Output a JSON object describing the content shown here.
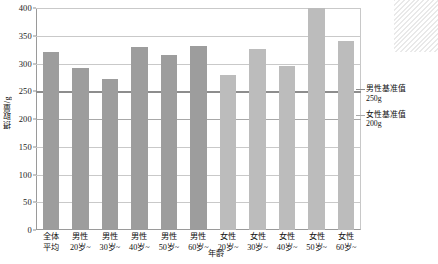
{
  "chart_data": {
    "type": "bar",
    "title": "",
    "xlabel": "年龄",
    "ylabel": "摂取量/g",
    "ylim": [
      0,
      400
    ],
    "ytick_step": 50,
    "yticks": [
      "0",
      "50",
      "100",
      "150",
      "200",
      "250",
      "300",
      "350",
      "400"
    ],
    "grid": true,
    "legend_position": "right",
    "categories": [
      {
        "line1": "全体",
        "line2": "平均",
        "group": "all"
      },
      {
        "line1": "男性",
        "line2": "20岁~",
        "group": "male"
      },
      {
        "line1": "男性",
        "line2": "30岁~",
        "group": "male"
      },
      {
        "line1": "男性",
        "line2": "40岁~",
        "group": "male"
      },
      {
        "line1": "男性",
        "line2": "50岁~",
        "group": "male"
      },
      {
        "line1": "男性",
        "line2": "60岁~",
        "group": "male"
      },
      {
        "line1": "女性",
        "line2": "20岁~",
        "group": "female"
      },
      {
        "line1": "女性",
        "line2": "30岁~",
        "group": "female"
      },
      {
        "line1": "女性",
        "line2": "40岁~",
        "group": "female"
      },
      {
        "line1": "女性",
        "line2": "50岁~",
        "group": "female"
      },
      {
        "line1": "女性",
        "line2": "60岁~",
        "group": "female"
      }
    ],
    "values": [
      320,
      292,
      273,
      330,
      316,
      332,
      280,
      326,
      295,
      414,
      340
    ],
    "reference_lines": [
      {
        "value": 250,
        "label_line1": "男性基准值",
        "label_line2": "250g",
        "color": "#8d8d8d"
      },
      {
        "value": 200,
        "label_line1": "女性基准值",
        "label_line2": "200g",
        "color": "#a8a8a8"
      }
    ],
    "colors": {
      "bar_male": "#9d9d9d",
      "bar_female": "#bcbcbc",
      "grid": "#c9c9c9",
      "axis": "#9a9a9a"
    }
  }
}
